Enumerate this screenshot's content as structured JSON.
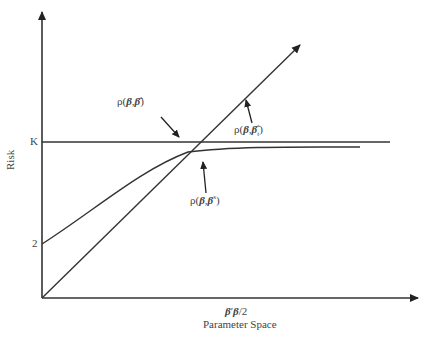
{
  "diagram": {
    "y_axis_label": "Risk",
    "x_axis_label": "Parameter Space",
    "x_marker_label": "β′β/2",
    "y_ticks": [
      {
        "label": "K"
      },
      {
        "label": "2"
      }
    ],
    "annotations": [
      {
        "id": "rho_hat",
        "label": "ρ(β, β̂)"
      },
      {
        "id": "rho_hat_t",
        "label": "ρ(β, β̂_t)"
      },
      {
        "id": "rho_s",
        "label": "ρ(β, β^s)"
      }
    ],
    "curves": [
      {
        "name": "MLE risk",
        "description": "horizontal line at K",
        "label": "ρ(β, β̂)"
      },
      {
        "name": "pretest/restricted risk",
        "description": "straight line from origin",
        "label": "ρ(β, β̂_t)"
      },
      {
        "name": "Stein risk",
        "description": "concave curve from 2 approaching K",
        "label": "ρ(β, β^s)"
      }
    ],
    "colors": {
      "lines": "#333333",
      "text": "#444444",
      "background": "#ffffff"
    }
  }
}
